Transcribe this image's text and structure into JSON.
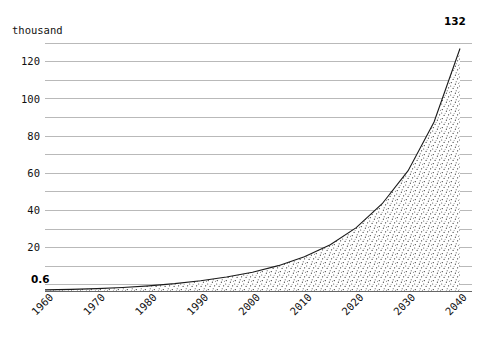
{
  "chart_data": {
    "type": "area",
    "title": "",
    "subtitle": "",
    "xlabel": "",
    "ylabel": "thousand",
    "unit_label": "thousand",
    "grid": true,
    "legend": "none",
    "xlim": [
      1960,
      2040
    ],
    "ylim": [
      0,
      135
    ],
    "x_tick_labels": [
      "1960",
      "1970",
      "1980",
      "1990",
      "2000",
      "2010",
      "2020",
      "2030",
      "2040"
    ],
    "x_ticks": [
      1960,
      1970,
      1980,
      1990,
      2000,
      2010,
      2020,
      2030,
      2040
    ],
    "y_tick_labels": [
      "20",
      "40",
      "60",
      "80",
      "100",
      "120"
    ],
    "y_ticks": [
      20,
      40,
      60,
      80,
      100,
      120
    ],
    "y_minor_ticks": [
      10,
      30,
      50,
      70,
      90,
      110,
      130
    ],
    "annotations": [
      {
        "name": "start-value",
        "text": "0.6",
        "x": 1960,
        "y": 0.6,
        "bold": true
      },
      {
        "name": "end-value",
        "text": "132",
        "x": 2040,
        "y": 132,
        "bold": true
      }
    ],
    "series": [
      {
        "name": "value",
        "x": [
          1960,
          1965,
          1970,
          1975,
          1980,
          1985,
          1990,
          1995,
          2000,
          2005,
          2010,
          2015,
          2020,
          2025,
          2030,
          2035,
          2040
        ],
        "values": [
          0.6,
          0.9,
          1.3,
          1.9,
          2.8,
          4.0,
          5.6,
          7.6,
          10.2,
          13.8,
          18.6,
          25.2,
          34.5,
          47.5,
          65.5,
          92.0,
          132.0
        ]
      }
    ],
    "colors": {
      "line": "#1a1a1a",
      "grid": "#a8a8a8",
      "axis": "#555555",
      "fill_stipple": "#333333",
      "background": "#ffffff",
      "text": "#111111"
    }
  },
  "layout": {
    "plot_left": 45,
    "plot_right": 472,
    "plot_top": 43,
    "plot_bottom": 291,
    "curve_end_x": 460
  }
}
